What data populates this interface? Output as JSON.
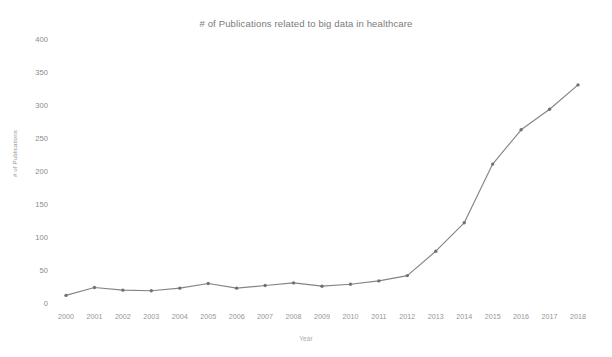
{
  "chart_data": {
    "type": "line",
    "title": "# of Publications related to big data in healthcare",
    "xlabel": "Year",
    "ylabel": "# of Publications",
    "grid": false,
    "legend": "none",
    "categories": [
      "2000",
      "2001",
      "2002",
      "2003",
      "2004",
      "2005",
      "2006",
      "2007",
      "2008",
      "2009",
      "2010",
      "2011",
      "2012",
      "2013",
      "2014",
      "2015",
      "2016",
      "2017",
      "2018"
    ],
    "values": [
      13,
      25,
      21,
      20,
      24,
      31,
      24,
      28,
      32,
      27,
      30,
      35,
      43,
      80,
      123,
      212,
      264,
      295,
      332
    ],
    "series": [
      {
        "name": "# of Publications",
        "values": [
          13,
          25,
          21,
          20,
          24,
          31,
          24,
          28,
          32,
          27,
          30,
          35,
          43,
          80,
          123,
          212,
          264,
          295,
          332
        ]
      }
    ],
    "ylim": [
      0,
      400
    ],
    "yticks": [
      0,
      50,
      100,
      150,
      200,
      250,
      300,
      350,
      400
    ],
    "ytick_labels": [
      "0",
      "50",
      "100",
      "150",
      "200",
      "250",
      "300",
      "350",
      "400"
    ],
    "line_color": "#7d7d7d",
    "marker_color": "#6d6d6d",
    "background_color": "#ffffff"
  }
}
